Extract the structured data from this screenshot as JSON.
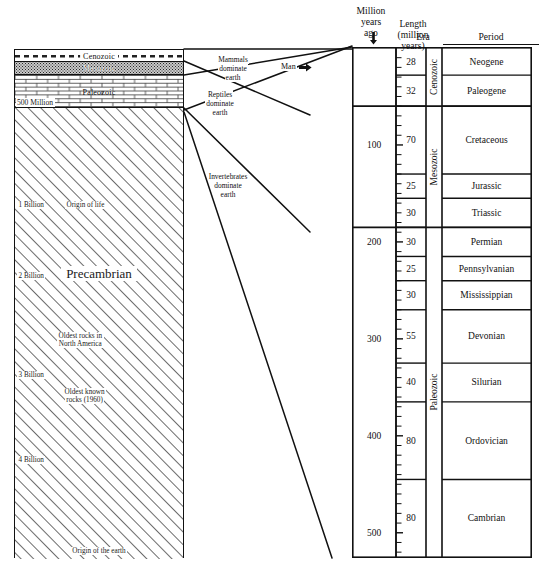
{
  "figure": {
    "left_diagram": {
      "bands": [
        {
          "id": "cenozoic",
          "label": "Cenozoic",
          "pattern": "dashes"
        },
        {
          "id": "mesozoic",
          "label": "Mesozoic",
          "pattern": "stipple"
        },
        {
          "id": "paleozoic",
          "label": "Paleozoic",
          "pattern": "brick"
        },
        {
          "id": "precambrian",
          "label": "Precambrian",
          "pattern": "diagonal-hatch"
        }
      ],
      "scale_500": "500 Million",
      "notes": {
        "one_billion": "1 Billion",
        "origin_of_life": "Origin of life",
        "two_billion": "2 Billion",
        "oldest_rocks_na_line1": "Oldest rocks in",
        "oldest_rocks_na_line2": "North America",
        "three_billion": "3 Billion",
        "oldest_known_line1": "Oldest known",
        "oldest_known_line2": "rocks (1960)",
        "four_billion": "4 Billion",
        "origin_of_earth": "Origin of the earth"
      }
    },
    "annotations": {
      "mammals_line1": "Mammals",
      "mammals_line2": "dominate",
      "mammals_line3": "earth",
      "reptiles_line1": "Reptiles",
      "reptiles_line2": "dominate",
      "reptiles_line3": "earth",
      "invertebrates_line1": "Invertebrates",
      "invertebrates_line2": "dominate",
      "invertebrates_line3": "earth",
      "man": "Man",
      "man_arrow_icon": "right-arrow-icon"
    },
    "table": {
      "headers": {
        "mya_line1": "Million",
        "mya_line2": "years",
        "mya_line3": "ago",
        "length_line1": "Length",
        "length_line2": "(million",
        "length_line3": "years)",
        "era": "Era",
        "period": "Period"
      },
      "axis_labels": [
        "100",
        "200",
        "300",
        "400",
        "500"
      ],
      "eras": [
        {
          "name": "Cenozoic",
          "start_mya": 0,
          "end_mya": 60
        },
        {
          "name": "Mesozoic",
          "start_mya": 60,
          "end_mya": 185
        },
        {
          "name": "Paleozoic",
          "start_mya": 185,
          "end_mya": 525
        }
      ],
      "periods": [
        {
          "period": "Neogene",
          "length": "28",
          "era": "Cenozoic"
        },
        {
          "period": "Paleogene",
          "length": "32",
          "era": "Cenozoic"
        },
        {
          "period": "Cretaceous",
          "length": "70",
          "era": "Mesozoic"
        },
        {
          "period": "Jurassic",
          "length": "25",
          "era": "Mesozoic"
        },
        {
          "period": "Triassic",
          "length": "30",
          "era": "Mesozoic"
        },
        {
          "period": "Permian",
          "length": "30",
          "era": "Paleozoic"
        },
        {
          "period": "Pennsylvanian",
          "length": "25",
          "era": "Paleozoic"
        },
        {
          "period": "Mississippian",
          "length": "30",
          "era": "Paleozoic"
        },
        {
          "period": "Devonian",
          "length": "55",
          "era": "Paleozoic"
        },
        {
          "period": "Silurian",
          "length": "40",
          "era": "Paleozoic"
        },
        {
          "period": "Ordovician",
          "length": "80",
          "era": "Paleozoic"
        },
        {
          "period": "Cambrian",
          "length": "80",
          "era": "Paleozoic"
        }
      ]
    },
    "colors": {
      "ink": "#111111",
      "mesozoic_fill": "#c9c9c9",
      "paper": "#ffffff"
    }
  },
  "chart_data": {
    "type": "table",
    "xlabel": "",
    "ylabel": "Million years ago",
    "ylim": [
      0,
      525
    ],
    "grid": false,
    "legend": "none",
    "columns": [
      "Million years ago",
      "Length (million years)",
      "Era",
      "Period"
    ],
    "categories": [
      "Neogene",
      "Paleogene",
      "Cretaceous",
      "Jurassic",
      "Triassic",
      "Permian",
      "Pennsylvanian",
      "Mississippian",
      "Devonian",
      "Silurian",
      "Ordovician",
      "Cambrian"
    ],
    "values": [
      28,
      32,
      70,
      25,
      30,
      30,
      25,
      30,
      55,
      40,
      80,
      80
    ],
    "series": [
      {
        "name": "Length (million years)",
        "values": [
          28,
          32,
          70,
          25,
          30,
          30,
          25,
          30,
          55,
          40,
          80,
          80
        ]
      }
    ],
    "tick_labels": [
      "100",
      "200",
      "300",
      "400",
      "500"
    ],
    "annotations": [
      "Mammals dominate earth",
      "Man",
      "Reptiles dominate earth",
      "Invertebrates dominate earth",
      "500 Million",
      "1 Billion",
      "Origin of life",
      "2 Billion",
      "Oldest rocks in North America",
      "3 Billion",
      "Oldest known rocks (1960)",
      "4 Billion",
      "Origin of the earth",
      "Precambrian"
    ]
  }
}
